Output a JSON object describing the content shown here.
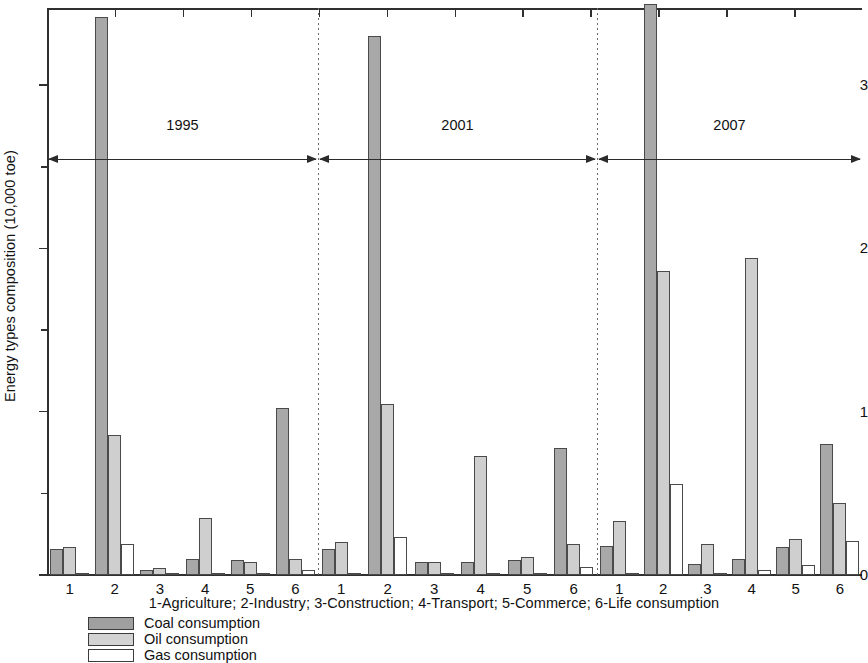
{
  "chart_data": {
    "type": "bar",
    "title": "",
    "xlabel": "1-Agriculture; 2-Industry; 3-Construction; 4-Transport; 5-Commerce; 6-Life consumption",
    "ylabel": "Energy types composition (10,000 toe)",
    "ylim": [
      0,
      3.5
    ],
    "yticks": [
      0,
      1,
      2,
      3
    ],
    "ytick_labels": [
      "0",
      "1",
      "2",
      "3"
    ],
    "grid": false,
    "legend_position": "bottom-left",
    "categories": [
      "1",
      "2",
      "3",
      "4",
      "5",
      "6"
    ],
    "category_names": [
      "Agriculture",
      "Industry",
      "Construction",
      "Transport",
      "Commerce",
      "Life consumption"
    ],
    "periods": [
      "1995",
      "2001",
      "2007"
    ],
    "series": [
      {
        "name": "Coal consumption",
        "color": "#a8a8a8",
        "values_by_period": {
          "1995": [
            0.16,
            3.42,
            0.03,
            0.1,
            0.09,
            1.02
          ],
          "2001": [
            0.16,
            3.3,
            0.08,
            0.08,
            0.09,
            0.78
          ],
          "2007": [
            0.18,
            3.55,
            0.07,
            0.1,
            0.17,
            0.8
          ]
        }
      },
      {
        "name": "Oil consumption",
        "color": "#cfcfcf",
        "values_by_period": {
          "1995": [
            0.17,
            0.86,
            0.04,
            0.35,
            0.08,
            0.1
          ],
          "2001": [
            0.2,
            1.05,
            0.08,
            0.73,
            0.11,
            0.19
          ],
          "2007": [
            0.33,
            1.86,
            0.19,
            1.94,
            0.22,
            0.44
          ]
        }
      },
      {
        "name": "Gas consumption",
        "color": "#ffffff",
        "values_by_period": {
          "1995": [
            0.0,
            0.19,
            0.0,
            0.0,
            0.0,
            0.03
          ],
          "2001": [
            0.0,
            0.23,
            0.0,
            0.0,
            0.0,
            0.05
          ],
          "2007": [
            0.01,
            0.56,
            0.01,
            0.03,
            0.06,
            0.21
          ]
        }
      }
    ]
  },
  "axis": {
    "ylabel": "Energy types composition (10,000 toe)",
    "ytick_labels": [
      "0",
      "1",
      "2",
      "3"
    ]
  },
  "periods": [
    {
      "label": "1995"
    },
    {
      "label": "2001"
    },
    {
      "label": "2007"
    }
  ],
  "caption": {
    "categories": "1-Agriculture; 2-Industry; 3-Construction; 4-Transport; 5-Commerce; 6-Life consumption"
  },
  "legend": {
    "items": [
      {
        "label": "Coal consumption",
        "swatch": "coal"
      },
      {
        "label": "Oil consumption",
        "swatch": "oil"
      },
      {
        "label": "Gas consumption",
        "swatch": "gas"
      }
    ]
  }
}
